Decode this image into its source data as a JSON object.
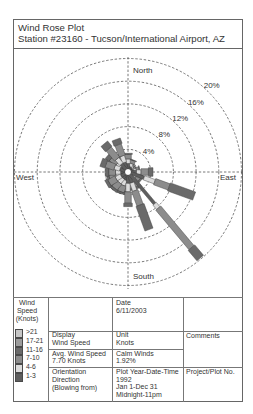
{
  "header": {
    "title": "Wind Rose Plot",
    "station": "Station #23160 - Tucson/International Airport, AZ"
  },
  "chart_data": {
    "type": "bar",
    "polar": true,
    "stacked": true,
    "title": "Wind Rose Plot",
    "subtitle": "Station #23160 - Tucson/International Airport, AZ",
    "compass_labels": {
      "north": "North",
      "south": "South",
      "east": "East",
      "west": "West"
    },
    "rings": [
      4,
      8,
      12,
      16,
      20
    ],
    "ring_labels": [
      "4%",
      "8%",
      "12%",
      "16%",
      "20%"
    ],
    "grid": true,
    "value_unit": "% frequency",
    "orientation": "Direction (Blowing from)",
    "directions": [
      0,
      10,
      20,
      30,
      40,
      50,
      60,
      70,
      80,
      90,
      100,
      110,
      120,
      130,
      140,
      150,
      160,
      170,
      180,
      190,
      200,
      210,
      220,
      230,
      240,
      250,
      260,
      270,
      280,
      290,
      300,
      310,
      320,
      330,
      340,
      350
    ],
    "series": [
      {
        "name": "1-3",
        "color": "#5e5e5e",
        "values": [
          1.5,
          1.2,
          1.0,
          0.9,
          0.8,
          0.7,
          0.7,
          0.8,
          1.0,
          1.5,
          1.0,
          3.0,
          0.9,
          1.0,
          7.3,
          1.2,
          2.0,
          1.2,
          2.0,
          1.5,
          1.5,
          1.4,
          1.4,
          1.4,
          1.4,
          1.3,
          1.2,
          1.3,
          1.2,
          1.5,
          1.3,
          1.4,
          1.8,
          1.2,
          1.8,
          1.0
        ]
      },
      {
        "name": "4-6",
        "color": "#dcdcdc",
        "values": [
          0.8,
          0.6,
          0.6,
          0.5,
          0.4,
          0.4,
          0.3,
          0.4,
          0.5,
          0.8,
          0.6,
          2.0,
          0.6,
          0.6,
          1.0,
          0.8,
          1.5,
          0.8,
          1.5,
          1.0,
          1.0,
          1.0,
          1.0,
          1.0,
          1.0,
          0.9,
          0.8,
          0.9,
          0.8,
          1.0,
          0.9,
          1.0,
          1.2,
          0.8,
          1.2,
          0.6
        ]
      },
      {
        "name": "7-10",
        "color": "#8c8c8c",
        "values": [
          0.8,
          0.4,
          0.6,
          0.3,
          0.3,
          0.2,
          0.2,
          0.3,
          0.5,
          1.3,
          0.8,
          2.7,
          0.6,
          0.8,
          9.1,
          1.0,
          2.7,
          1.0,
          2.0,
          1.0,
          1.2,
          1.2,
          1.3,
          1.2,
          1.4,
          1.2,
          1.0,
          1.2,
          1.0,
          1.6,
          1.2,
          1.4,
          2.3,
          1.0,
          2.1,
          0.6
        ]
      },
      {
        "name": "11-16",
        "color": "#6a6a6a",
        "values": [
          0.2,
          0,
          0.1,
          0,
          0,
          0,
          0,
          0,
          0.1,
          0.8,
          0.3,
          4.7,
          0.2,
          0.3,
          2.4,
          0.4,
          4.6,
          0.3,
          0.6,
          0.3,
          0.3,
          0.4,
          0.4,
          0.5,
          0.5,
          0.4,
          0.4,
          0.6,
          0.5,
          0.9,
          0.6,
          0.8,
          1.2,
          0.5,
          1.0,
          0.2
        ]
      },
      {
        "name": "17-21",
        "color": "#9c9c9c",
        "values": [
          0,
          0,
          0,
          0,
          0,
          0,
          0,
          0,
          0,
          0,
          0,
          0,
          0,
          0,
          0,
          0,
          0,
          0,
          0,
          0,
          0,
          0,
          0,
          0,
          0,
          0,
          0,
          0,
          0,
          0,
          0,
          0,
          0,
          0,
          0,
          0
        ]
      },
      {
        "name": ">21",
        "color": "#c6c6c6",
        "values": [
          0,
          0,
          0,
          0,
          0,
          0,
          0,
          0,
          0,
          0,
          0,
          0,
          0,
          0,
          0,
          0,
          0,
          0,
          0,
          0,
          0,
          0,
          0,
          0,
          0,
          0,
          0,
          0,
          0,
          0,
          0,
          0,
          0,
          0,
          0,
          0
        ]
      }
    ],
    "calm_winds_pct": 1.92,
    "avg_wind_speed_knots": 7.7
  },
  "legend": {
    "title_lines": [
      "Wind",
      "Speed",
      "(Knots)"
    ],
    "items": [
      {
        "label": ">21",
        "color": "#c6c6c6"
      },
      {
        "label": "17-21",
        "color": "#9c9c9c"
      },
      {
        "label": "11-16",
        "color": "#6a6a6a"
      },
      {
        "label": "7-10",
        "color": "#8c8c8c"
      },
      {
        "label": "4-6",
        "color": "#dcdcdc"
      },
      {
        "label": "1-3",
        "color": "#5e5e5e"
      }
    ]
  },
  "info": {
    "date": {
      "label": "Date",
      "value": "6/11/2003"
    },
    "display": {
      "label": "Display",
      "value": "Wind Speed"
    },
    "unit": {
      "label": "Unit",
      "value": "Knots"
    },
    "avg_wind_speed": {
      "label": "Avg. Wind Speed",
      "value": "7.70 Knots"
    },
    "calm_winds": {
      "label": "Calm Winds",
      "value": "1.92%"
    },
    "orientation": {
      "lines": [
        "Orientation",
        "Direction",
        "(Blowing from)"
      ]
    },
    "plot_period": {
      "label": "Plot Year-Date-Time",
      "lines": [
        "1992",
        "Jan 1-Dec 31",
        "Midnight-11pm"
      ]
    },
    "comments": {
      "label": "Comments"
    },
    "project": {
      "label": "Project/Plot No."
    }
  }
}
